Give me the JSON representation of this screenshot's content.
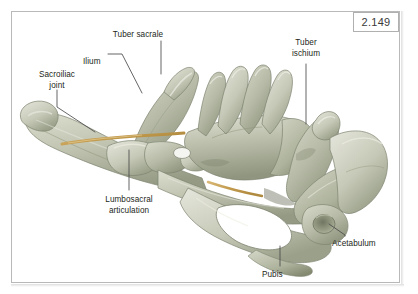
{
  "figure": {
    "number": "2.149",
    "background_color": "#ffffff",
    "frame_color": "#b9b9b9",
    "bone_color": "#c3c6b4",
    "bone_shadow_color": "#8e9480",
    "bone_highlight_color": "#dfe0d3",
    "joint_cartilage_color": "#c8a45e",
    "label_color": "#231f20",
    "leader_color": "#4a4a4a"
  },
  "labels": [
    {
      "id": "tuber-sacrale",
      "lines": [
        "Tuber sacrale"
      ],
      "x": 138,
      "y": 30,
      "align": "center"
    },
    {
      "id": "ilium",
      "lines": [
        "Ilium"
      ],
      "x": 83,
      "y": 57,
      "align": "left"
    },
    {
      "id": "sacroiliac-joint",
      "lines": [
        "Sacroiliac",
        "joint"
      ],
      "x": 33,
      "y": 70,
      "align": "center"
    },
    {
      "id": "tuber-ischium",
      "lines": [
        "Tuber",
        "ischium"
      ],
      "x": 283,
      "y": 38,
      "align": "center"
    },
    {
      "id": "lumbosacral-articulation",
      "lines": [
        "Lumbosacral",
        "articulation"
      ],
      "x": 95,
      "y": 195,
      "align": "center"
    },
    {
      "id": "acetabulum",
      "lines": [
        "Acetabulum"
      ],
      "x": 332,
      "y": 239,
      "align": "left"
    },
    {
      "id": "pubis",
      "lines": [
        "Pubis"
      ],
      "x": 262,
      "y": 271,
      "align": "left"
    }
  ],
  "structures": [
    {
      "id": "ilium-wing-left",
      "name": "Wing of ilium (left)"
    },
    {
      "id": "tuber-coxae",
      "name": "Tuber coxae"
    },
    {
      "id": "tuber-sacrale-process",
      "name": "Tuber sacrale"
    },
    {
      "id": "sacrum",
      "name": "Sacrum with dorsal spinous processes"
    },
    {
      "id": "lumbosacral-joint",
      "name": "Lumbosacral articulation"
    },
    {
      "id": "sacroiliac-joint-line",
      "name": "Sacroiliac joint surface"
    },
    {
      "id": "obturator-foramen",
      "name": "Obturator foramen"
    },
    {
      "id": "ischium",
      "name": "Ischium"
    },
    {
      "id": "tuber-ischii",
      "name": "Tuber ischiadicum"
    },
    {
      "id": "acetabulum-socket",
      "name": "Acetabulum"
    },
    {
      "id": "pubis-bone",
      "name": "Pubis"
    }
  ]
}
